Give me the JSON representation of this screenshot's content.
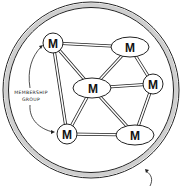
{
  "diagram": {
    "caption": {
      "line1": "MEMBERSHIP",
      "line2": "GROUP"
    },
    "node_label": "M",
    "nodes": [
      {
        "id": "m1",
        "label": "M",
        "shape": "circle",
        "cx": 53,
        "cy": 43
      },
      {
        "id": "m2",
        "label": "M",
        "shape": "ellipse",
        "cx": 130,
        "cy": 47
      },
      {
        "id": "m3",
        "label": "M",
        "shape": "ellipse",
        "cx": 92,
        "cy": 88
      },
      {
        "id": "m4",
        "label": "M",
        "shape": "circle",
        "cx": 153,
        "cy": 84
      },
      {
        "id": "m5",
        "label": "M",
        "shape": "circle",
        "cx": 67,
        "cy": 134
      },
      {
        "id": "m6",
        "label": "M",
        "shape": "ellipse",
        "cx": 135,
        "cy": 135
      }
    ],
    "edges": [
      [
        "m1",
        "m2"
      ],
      [
        "m1",
        "m3"
      ],
      [
        "m1",
        "m5"
      ],
      [
        "m2",
        "m3"
      ],
      [
        "m2",
        "m4"
      ],
      [
        "m3",
        "m4"
      ],
      [
        "m3",
        "m5"
      ],
      [
        "m3",
        "m6"
      ],
      [
        "m4",
        "m6"
      ],
      [
        "m5",
        "m6"
      ]
    ],
    "colors": {
      "ring_fill": "#d8d8d8",
      "stroke": "#222222",
      "background": "#ffffff"
    }
  }
}
